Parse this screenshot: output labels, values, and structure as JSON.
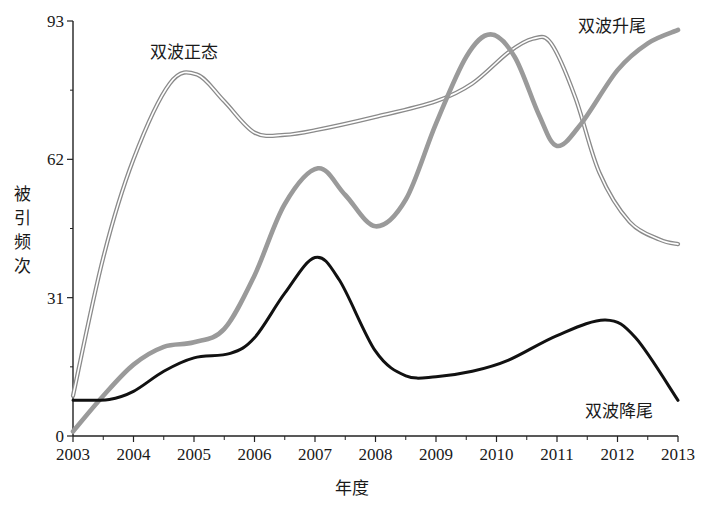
{
  "chart_data": {
    "type": "line",
    "title": "",
    "xlabel": "年度",
    "ylabel": "被引频次",
    "xlim": [
      2003,
      2013
    ],
    "ylim": [
      0,
      93
    ],
    "x_ticks": [
      "2003",
      "2004",
      "2005",
      "2006",
      "2007",
      "2008",
      "2009",
      "2010",
      "2011",
      "2012",
      "2013"
    ],
    "y_ticks": [
      "0",
      "31",
      "62",
      "93"
    ],
    "grid": false,
    "legend": "inline annotations",
    "series": [
      {
        "name": "双波正态",
        "style": "double-line",
        "color": "#8a8a8a",
        "label_pos": [
          150,
          58
        ],
        "points": [
          [
            2003,
            9
          ],
          [
            2003.5,
            40
          ],
          [
            2004,
            62
          ],
          [
            2004.6,
            79
          ],
          [
            2005.05,
            81
          ],
          [
            2005.5,
            75
          ],
          [
            2006,
            68
          ],
          [
            2006.5,
            67.5
          ],
          [
            2007,
            68.5
          ],
          [
            2008,
            71.5
          ],
          [
            2009,
            75
          ],
          [
            2009.6,
            79
          ],
          [
            2010.2,
            86
          ],
          [
            2010.6,
            89
          ],
          [
            2010.9,
            88
          ],
          [
            2011.3,
            76
          ],
          [
            2011.7,
            59
          ],
          [
            2012.2,
            48
          ],
          [
            2012.7,
            44
          ],
          [
            2013,
            43
          ]
        ]
      },
      {
        "name": "双波升尾",
        "style": "thick-grey",
        "color": "#9a9a9a",
        "label_pos": [
          578,
          32
        ],
        "points": [
          [
            2003,
            1
          ],
          [
            2003.5,
            9
          ],
          [
            2004,
            16
          ],
          [
            2004.5,
            20
          ],
          [
            2005,
            21
          ],
          [
            2005.5,
            24
          ],
          [
            2006,
            36
          ],
          [
            2006.5,
            52
          ],
          [
            2007.05,
            60
          ],
          [
            2007.5,
            54
          ],
          [
            2008,
            47
          ],
          [
            2008.5,
            53
          ],
          [
            2009,
            70
          ],
          [
            2009.5,
            85
          ],
          [
            2009.9,
            90
          ],
          [
            2010.3,
            85
          ],
          [
            2010.7,
            72
          ],
          [
            2011,
            65
          ],
          [
            2011.4,
            70
          ],
          [
            2012,
            82
          ],
          [
            2012.5,
            88
          ],
          [
            2013,
            91
          ]
        ]
      },
      {
        "name": "双波降尾",
        "style": "thick-black",
        "color": "#111111",
        "label_pos": [
          585,
          417
        ],
        "points": [
          [
            2003,
            8
          ],
          [
            2003.6,
            8.2
          ],
          [
            2004,
            10
          ],
          [
            2004.5,
            14.5
          ],
          [
            2005,
            17.5
          ],
          [
            2005.6,
            18.5
          ],
          [
            2006,
            22
          ],
          [
            2006.5,
            32
          ],
          [
            2007,
            40
          ],
          [
            2007.4,
            35
          ],
          [
            2008,
            19
          ],
          [
            2008.5,
            13.5
          ],
          [
            2009,
            13.3
          ],
          [
            2009.6,
            14.5
          ],
          [
            2010.2,
            17
          ],
          [
            2011,
            22.5
          ],
          [
            2011.8,
            26
          ],
          [
            2012.3,
            22
          ],
          [
            2013,
            8
          ]
        ]
      }
    ]
  },
  "axes": {
    "x_title": "年度",
    "y_title_chars": [
      "被",
      "引",
      "频",
      "次"
    ]
  }
}
